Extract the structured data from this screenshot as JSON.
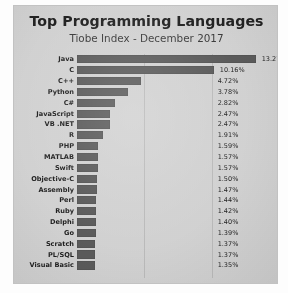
{
  "chart_data": {
    "type": "bar",
    "orientation": "horizontal",
    "title": "Top Programming Languages",
    "subtitle": "Tiobe Index - December 2017",
    "xlabel": "",
    "ylabel": "",
    "xlim": [
      0,
      15
    ],
    "grid": true,
    "gridlines": [
      5,
      10
    ],
    "legend": false,
    "bar_color": "#5c5c5c",
    "background_color": "#d5d5d5",
    "categories": [
      "Java",
      "C",
      "C++",
      "Python",
      "C#",
      "JavaScript",
      "VB .NET",
      "R",
      "PHP",
      "MATLAB",
      "Swift",
      "Objective-C",
      "Assembly",
      "Perl",
      "Ruby",
      "Delphi",
      "Go",
      "Scratch",
      "PL/SQL",
      "Visual Basic"
    ],
    "values": [
      13.27,
      10.16,
      4.72,
      3.78,
      2.82,
      2.47,
      2.47,
      1.91,
      1.59,
      1.57,
      1.57,
      1.5,
      1.47,
      1.44,
      1.42,
      1.4,
      1.39,
      1.37,
      1.37,
      1.35
    ],
    "value_labels": [
      "13.27%",
      "10.16%",
      "4.72%",
      "3.78%",
      "2.82%",
      "2.47%",
      "2.47%",
      "1.91%",
      "1.59%",
      "1.57%",
      "1.57%",
      "1.50%",
      "1.47%",
      "1.44%",
      "1.42%",
      "1.40%",
      "1.39%",
      "1.37%",
      "1.37%",
      "1.35%"
    ]
  }
}
